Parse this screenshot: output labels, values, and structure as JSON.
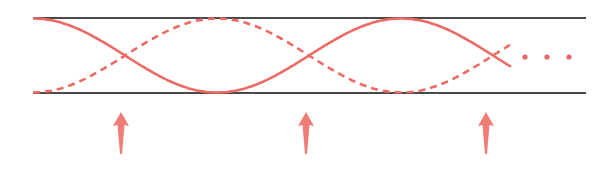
{
  "diagram": {
    "colors": {
      "wave": "#ec6a63",
      "boundary": "#4a4a4a",
      "arrow": "#f07c76",
      "ellipsis": "#e4656a"
    },
    "waves": [
      {
        "name": "solid-wave",
        "style": "solid",
        "phase": "starts-at-top"
      },
      {
        "name": "dashed-wave",
        "style": "dashed",
        "phase": "starts-at-bottom"
      }
    ],
    "node_arrow_count": 3,
    "ellipsis_dot_count": 3
  }
}
